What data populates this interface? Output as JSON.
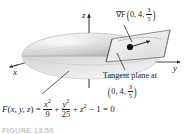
{
  "figure": {
    "kind": "3d-surface-diagram",
    "axes": {
      "x_label": "x",
      "y_label": "y",
      "z_label": "z"
    },
    "annotations": {
      "gradient_label": "∇F",
      "gradient_point_open": "(",
      "gradient_point_a": "0, 4,",
      "gradient_frac_num": "3",
      "gradient_frac_den": "5",
      "gradient_point_close": ")",
      "tangent_text": "Tangent plane at",
      "tangent_point_open": "(",
      "tangent_point_a": "0, 4,",
      "tangent_frac_num": "3",
      "tangent_frac_den": "5",
      "tangent_point_close": ")"
    },
    "equation": {
      "lhs_function": "F",
      "lhs_open": "(",
      "lhs_args": "x, y, z",
      "lhs_close": ")",
      "equals_1": "=",
      "term1_base": "x",
      "term1_exp": "2",
      "term1_den": "9",
      "plus_1": "+",
      "term2_base": "y",
      "term2_exp": "2",
      "term2_den": "25",
      "plus_2": "+",
      "term3_base": "z",
      "term3_exp": "2",
      "minus": "−",
      "one": "1",
      "equals_2": "=",
      "zero": "0"
    },
    "caption": "FIGURE 13.56",
    "colors": {
      "ink": "#1a1a1a",
      "surface_light": "#f2f2f2",
      "surface_mid": "#c8c8c8",
      "surface_dark": "#9a9a9a",
      "plane_fill": "#ededed",
      "point_dot": "#111111",
      "caption_gray": "#c9c9c9"
    }
  }
}
